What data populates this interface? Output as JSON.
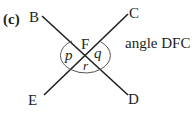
{
  "part_label": "(c)",
  "points": {
    "B": "B",
    "C": "C",
    "D": "D",
    "E": "E",
    "F": "F"
  },
  "angles": {
    "p": "p",
    "q": "q",
    "r": "r"
  },
  "caption": "angle DFC",
  "colors": {
    "line": "#231f20",
    "arc": "#555555"
  }
}
